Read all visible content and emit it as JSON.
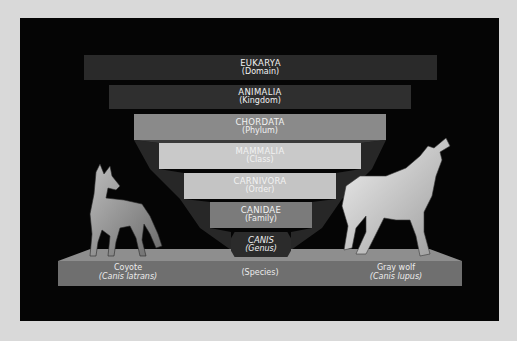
{
  "diagram": {
    "ranks": [
      {
        "name": "EUKARYA",
        "level": "(Domain)",
        "color": "#2a2a2a"
      },
      {
        "name": "ANIMALIA",
        "level": "(Kingdom)",
        "color": "#2f2f2f"
      },
      {
        "name": "CHORDATA",
        "level": "(Phylum)",
        "color": "#8a8a8a"
      },
      {
        "name": "MAMMALIA",
        "level": "(Class)",
        "color": "#c9c9c9"
      },
      {
        "name": "CARNIVORA",
        "level": "(Order)",
        "color": "#c4c4c4"
      },
      {
        "name": "CANIDAE",
        "level": "(Family)",
        "color": "#7b7b7b"
      },
      {
        "name": "CANIS",
        "level": "(Genus)",
        "color": "#2b2b2b"
      }
    ],
    "species": {
      "level": "(Species)",
      "left": {
        "common": "Coyote",
        "scientific": "(Canis latrans)"
      },
      "right": {
        "common": "Gray wolf",
        "scientific": "(Canis lupus)"
      }
    },
    "illustrations": {
      "left": "coyote-illustration",
      "right": "howling-gray-wolf-illustration"
    },
    "colors": {
      "background": "#d9d9d9",
      "panel": "#050505",
      "base": "#6f6f6f",
      "text": "#f2f2f2"
    }
  }
}
